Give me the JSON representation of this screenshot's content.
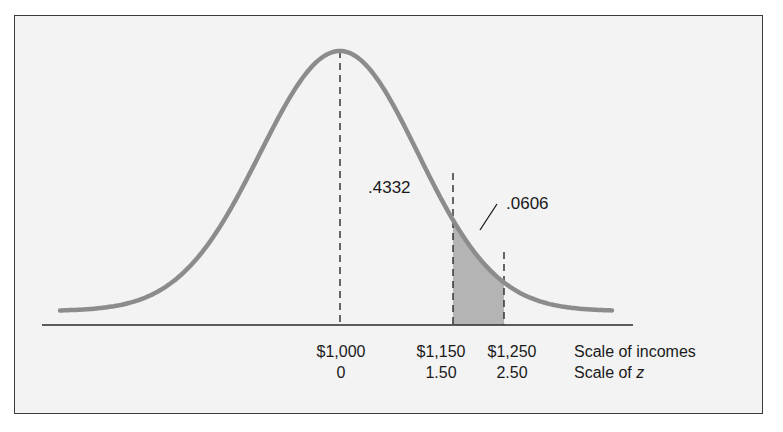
{
  "chart_data": {
    "type": "area",
    "title": "",
    "curve": {
      "mean_income": 1000,
      "mean_z": 0,
      "color": "#8c8c8c"
    },
    "shaded_region": {
      "from_income": 1150,
      "to_income": 1250,
      "from_z": 1.5,
      "to_z": 2.5,
      "area": 0.0606,
      "fill": "#b4b4b4"
    },
    "area_labels": [
      {
        "text": ".4332",
        "description": "area between mean and z = 1.50"
      },
      {
        "text": ".0606",
        "description": "shaded area between z = 1.50 and z = 2.50"
      }
    ],
    "x_scales": [
      {
        "name": "Scale of incomes",
        "ticks": [
          "$1,000",
          "$1,150",
          "$1,250"
        ],
        "values": [
          1000,
          1150,
          1250
        ]
      },
      {
        "name": "Scale of z",
        "ticks": [
          "0",
          "1.50",
          "2.50"
        ],
        "values": [
          0,
          1.5,
          2.5
        ]
      }
    ],
    "xlabel": "Scale of incomes / Scale of z",
    "ylabel": "",
    "grid": false,
    "legend": null
  },
  "labels": {
    "area_left": ".4332",
    "area_shaded": ".0606",
    "income_ticks": [
      "$1,000",
      "$1,150",
      "$1,250"
    ],
    "z_ticks": [
      "0",
      "1.50",
      "2.50"
    ],
    "income_scale_prefix": "Scale of incomes",
    "z_scale_prefix": "Scale of ",
    "z_scale_var": "z"
  }
}
